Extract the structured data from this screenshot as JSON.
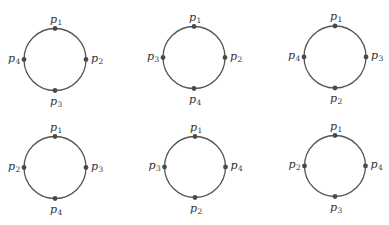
{
  "figure": {
    "colors": {
      "circle_stroke": "#555555",
      "point_fill": "#4a4a4a",
      "label_text": "#333333",
      "background": "#ffffff"
    },
    "circles": [
      {
        "id": "circle-1",
        "cx": 55,
        "cy": 59.5,
        "r": 31,
        "labels": {
          "top": {
            "base": "p",
            "sub": "1"
          },
          "right": {
            "base": "p",
            "sub": "2"
          },
          "bottom": {
            "base": "p",
            "sub": "3"
          },
          "left": {
            "base": "p",
            "sub": "4"
          }
        }
      },
      {
        "id": "circle-2",
        "cx": 194,
        "cy": 57.5,
        "r": 31,
        "labels": {
          "top": {
            "base": "p",
            "sub": "1"
          },
          "right": {
            "base": "p",
            "sub": "2"
          },
          "bottom": {
            "base": "p",
            "sub": "4"
          },
          "left": {
            "base": "p",
            "sub": "3"
          }
        }
      },
      {
        "id": "circle-3",
        "cx": 335,
        "cy": 57,
        "r": 31,
        "labels": {
          "top": {
            "base": "p",
            "sub": "1"
          },
          "right": {
            "base": "p",
            "sub": "3"
          },
          "bottom": {
            "base": "p",
            "sub": "2"
          },
          "left": {
            "base": "p",
            "sub": "4"
          }
        }
      },
      {
        "id": "circle-4",
        "cx": 55,
        "cy": 167.5,
        "r": 31,
        "labels": {
          "top": {
            "base": "p",
            "sub": "1"
          },
          "right": {
            "base": "p",
            "sub": "3"
          },
          "bottom": {
            "base": "p",
            "sub": "4"
          },
          "left": {
            "base": "p",
            "sub": "2"
          }
        }
      },
      {
        "id": "circle-5",
        "cx": 195,
        "cy": 167,
        "r": 30.5,
        "labels": {
          "top": {
            "base": "p",
            "sub": "1"
          },
          "right": {
            "base": "p",
            "sub": "4"
          },
          "bottom": {
            "base": "p",
            "sub": "2"
          },
          "left": {
            "base": "p",
            "sub": "3"
          }
        }
      },
      {
        "id": "circle-6",
        "cx": 335,
        "cy": 166,
        "r": 30.5,
        "labels": {
          "top": {
            "base": "p",
            "sub": "1"
          },
          "right": {
            "base": "p",
            "sub": "4"
          },
          "bottom": {
            "base": "p",
            "sub": "3"
          },
          "left": {
            "base": "p",
            "sub": "2"
          }
        }
      }
    ]
  }
}
